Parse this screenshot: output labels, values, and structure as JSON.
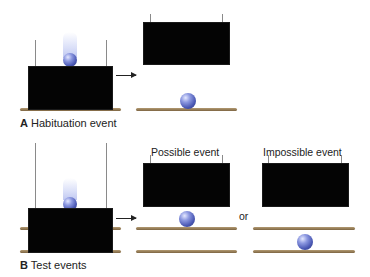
{
  "panel_a": {
    "letter": "A",
    "title": "Habituation event"
  },
  "panel_b": {
    "letter": "B",
    "title": "Test events",
    "possible_label": "Possible event",
    "or_label": "or",
    "impossible_label": "Impossible event"
  },
  "colors": {
    "screen": "#040404",
    "shelf": "#9b8460",
    "ball": "#5866c0",
    "background": "#ffffff"
  }
}
